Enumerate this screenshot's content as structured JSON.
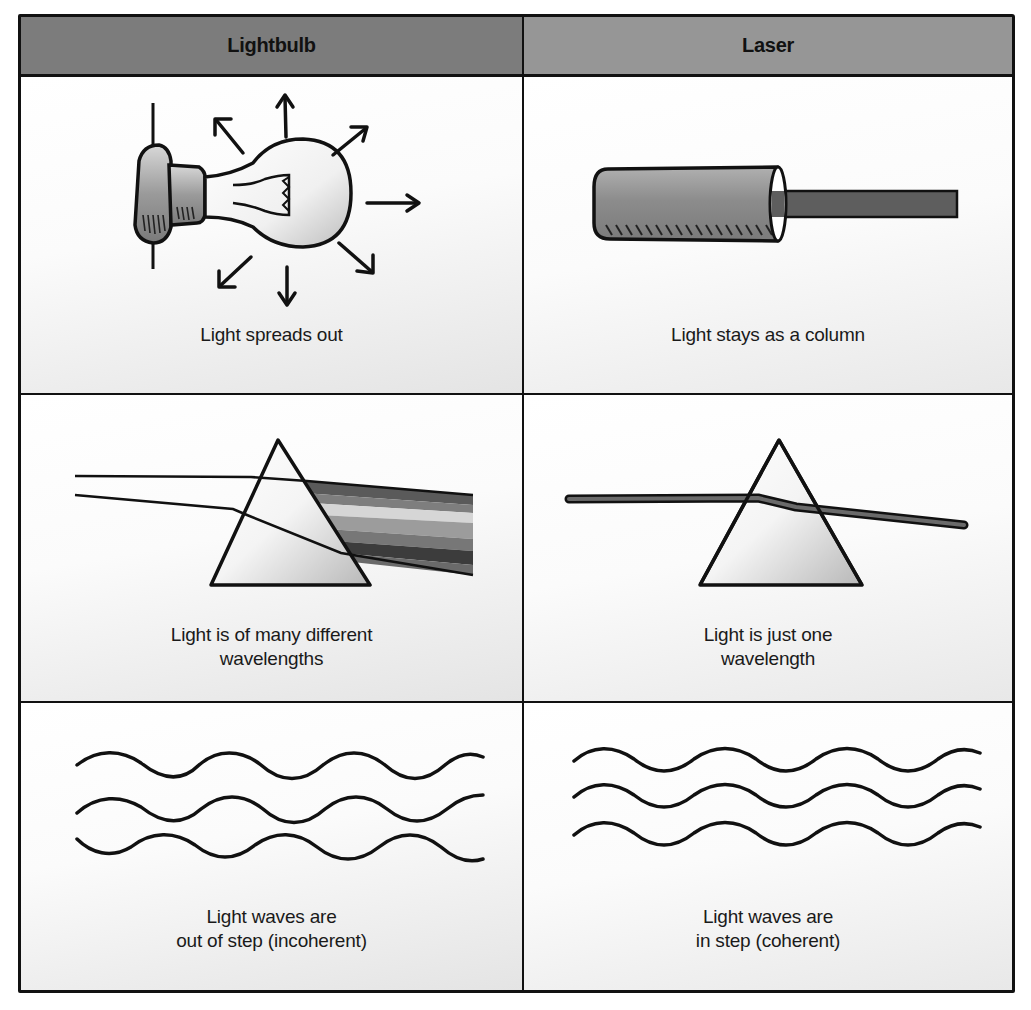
{
  "table": {
    "headers": [
      {
        "label": "Lightbulb",
        "color": "#7c7c7c"
      },
      {
        "label": "Laser",
        "color": "#969696"
      }
    ],
    "rows": [
      {
        "property": "beam spread",
        "lightbulb": {
          "illustration": "lightbulb-with-radiating-arrows",
          "caption": [
            "Light spreads out"
          ]
        },
        "laser": {
          "illustration": "laser-tube-with-column-beam",
          "caption": [
            "Light stays as a column"
          ]
        }
      },
      {
        "property": "wavelength",
        "lightbulb": {
          "illustration": "prism-dispersing-spectrum",
          "caption": [
            "Light is of many different",
            "wavelengths"
          ]
        },
        "laser": {
          "illustration": "prism-single-beam",
          "caption": [
            "Light is just one",
            "wavelength"
          ]
        }
      },
      {
        "property": "coherence",
        "lightbulb": {
          "illustration": "three-waves-out-of-phase",
          "caption": [
            "Light waves are",
            "out of step (incoherent)"
          ]
        },
        "laser": {
          "illustration": "three-waves-in-phase",
          "caption": [
            "Light waves are",
            "in step (coherent)"
          ]
        }
      }
    ]
  },
  "colors": {
    "line": "#111111",
    "header_left": "#7c7c7c",
    "header_right": "#969696",
    "beam": "#555555",
    "spectrum": [
      "#6a6a6a",
      "#8a8a8a",
      "#d0d0d0",
      "#9a9a9a",
      "#7a7a7a",
      "#3a3a3a",
      "#6a6a6a"
    ]
  }
}
